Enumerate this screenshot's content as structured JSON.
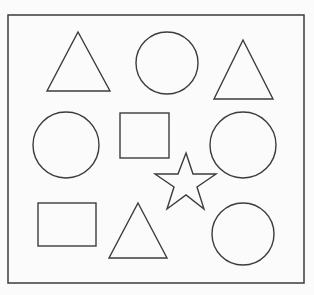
{
  "figure": {
    "background_color": "#fbfbfb",
    "stroke_color": "#3c3c3c",
    "canvas_width": 314,
    "canvas_height": 295,
    "frame": {
      "label": "outer-border",
      "x": 8,
      "y": 15,
      "width": 296,
      "height": 268
    },
    "shape_counts": {
      "triangle": 3,
      "circle": 4,
      "square": 2,
      "star": 1,
      "total": 10
    },
    "shapes": [
      {
        "id": "triangle-top-left",
        "kind": "triangle",
        "row": 1,
        "column": 1,
        "points": "78,32 110,91 47,91",
        "center_x": 78,
        "center_y": 71,
        "width": 63,
        "height": 59
      },
      {
        "id": "circle-top-center",
        "kind": "circle",
        "row": 1,
        "column": 2,
        "center_x": 167,
        "center_y": 63,
        "radius": 31
      },
      {
        "id": "triangle-top-right",
        "kind": "triangle",
        "row": 1,
        "column": 3,
        "points": "243,40 273,99 214,99",
        "center_x": 243,
        "center_y": 79,
        "width": 59,
        "height": 59
      },
      {
        "id": "circle-middle-left",
        "kind": "circle",
        "row": 2,
        "column": 1,
        "center_x": 66,
        "center_y": 145,
        "radius": 33
      },
      {
        "id": "square-middle-center",
        "kind": "square",
        "row": 2,
        "column": 2,
        "x": 120,
        "y": 113,
        "width": 49,
        "height": 45
      },
      {
        "id": "circle-middle-right",
        "kind": "circle",
        "row": 2,
        "column": 3,
        "center_x": 243,
        "center_y": 145,
        "radius": 33
      },
      {
        "id": "star-center-lower",
        "kind": "star",
        "row": 2.5,
        "column": 2.5,
        "center_x": 186,
        "center_y": 184,
        "outer_radius": 31,
        "inner_radius": 13,
        "points_count": 5,
        "points": "186,153 193,174 216,174 197,187 204,209 186,195 167,209 174,187 155,174 178,174"
      },
      {
        "id": "square-bottom-left",
        "kind": "square",
        "row": 3,
        "column": 1,
        "x": 38,
        "y": 203,
        "width": 58,
        "height": 43
      },
      {
        "id": "triangle-bottom-center",
        "kind": "triangle",
        "row": 3,
        "column": 2,
        "points": "138,203 167,258 109,258",
        "center_x": 138,
        "center_y": 240,
        "width": 58,
        "height": 55
      },
      {
        "id": "circle-bottom-right",
        "kind": "circle",
        "row": 3,
        "column": 3,
        "center_x": 243,
        "center_y": 234,
        "radius": 31
      }
    ]
  }
}
